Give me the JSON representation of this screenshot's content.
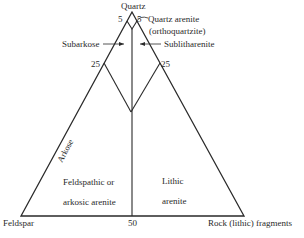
{
  "diagram": {
    "type": "ternary-classification",
    "vertices": {
      "top": "Quartz",
      "left": "Feldspar",
      "right": "Rock (lithic) fragments"
    },
    "tick_labels": {
      "top_left": "5",
      "top_right": "5",
      "mid_left": "25",
      "mid_right": "25",
      "base_mid": "50"
    },
    "fields": {
      "quartz_arenite_line1": "Quartz arenite",
      "quartz_arenite_line2": "(orthoquartzite)",
      "subarkose": "Subarkose",
      "sublitharenite": "Sublitharenite",
      "arkose": "Arkose",
      "feldspathic_line1": "Feldspathic or",
      "feldspathic_line2": "arkosic arenite",
      "lithic_line1": "Lithic",
      "lithic_line2": "arenite"
    },
    "line_color": "#2a2a2a"
  }
}
